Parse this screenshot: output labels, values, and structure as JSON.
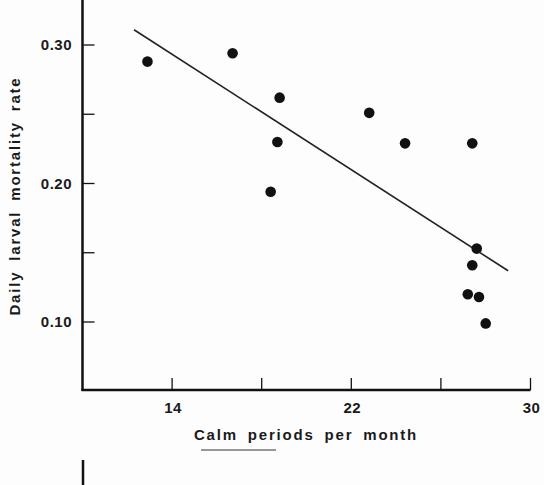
{
  "chart_data": {
    "type": "scatter",
    "title": "",
    "xlabel": "Calm periods per month",
    "ylabel": "Daily larval mortality rate",
    "xlim": [
      10,
      30
    ],
    "ylim": [
      0.05,
      0.33
    ],
    "x_ticks": [
      10,
      14,
      18,
      22,
      26,
      30
    ],
    "x_tick_labels": [
      "14",
      "22",
      "30"
    ],
    "x_tick_label_values": [
      14,
      22,
      30
    ],
    "y_ticks": [
      0.1,
      0.15,
      0.2,
      0.25,
      0.3
    ],
    "y_tick_labels": [
      "0.30",
      "0.20",
      "0.10"
    ],
    "y_tick_label_values": [
      0.3,
      0.2,
      0.1
    ],
    "grid": false,
    "legend": null,
    "series": [
      {
        "name": "observations",
        "marker": "filled-circle",
        "x": [
          12.9,
          16.7,
          18.8,
          18.7,
          18.4,
          22.8,
          24.4,
          27.4,
          27.6,
          27.4,
          27.2,
          27.7,
          28.0
        ],
        "y": [
          0.288,
          0.294,
          0.262,
          0.23,
          0.194,
          0.251,
          0.229,
          0.229,
          0.153,
          0.141,
          0.12,
          0.118,
          0.099
        ]
      }
    ],
    "regression_line": {
      "name": "fitted trend",
      "x": [
        12.3,
        29.0
      ],
      "y": [
        0.311,
        0.137
      ]
    }
  },
  "labels": {
    "x_axis_title": "Calm periods per month",
    "y_axis_title": "Daily larval mortality rate"
  },
  "colors": {
    "ink": "#111111",
    "background": "#fdfdfd"
  }
}
